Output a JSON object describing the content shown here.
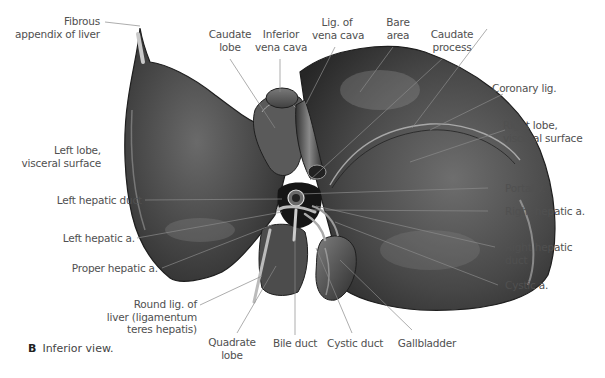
{
  "figure": {
    "caption_letter": "B",
    "caption_text": "Inferior view.",
    "colors": {
      "background": "#ffffff",
      "label_text": "#505050",
      "leader_line": "#8a8a8a",
      "organ_dark": "#2e2e2e",
      "organ_mid": "#5a5a5a",
      "organ_light": "#9a9a9a"
    }
  },
  "labels": {
    "fibrous_appendix": [
      "Fibrous",
      "appendix of liver"
    ],
    "caudate_lobe": [
      "Caudate",
      "lobe"
    ],
    "inferior_vena_cava": [
      "Inferior",
      "vena cava"
    ],
    "lig_vena_cava": [
      "Lig. of",
      "vena cava"
    ],
    "bare_area": [
      "Bare",
      "area"
    ],
    "caudate_process": [
      "Caudate",
      "process"
    ],
    "coronary_lig": "Coronary lig.",
    "right_lobe": [
      "Right lobe,",
      "visceral surface"
    ],
    "left_lobe": [
      "Left lobe,",
      "visceral surface"
    ],
    "left_hepatic_duct": "Left hepatic duct",
    "portal_v": "Portal v.",
    "right_hepatic_a": "Right hepatic a.",
    "left_hepatic_a": "Left hepatic a.",
    "right_hepatic_duct": [
      "Right hepatic",
      "duct"
    ],
    "proper_hepatic_a": "Proper hepatic a.",
    "cystic_a": "Cystic a.",
    "round_lig": [
      "Round lig. of",
      "liver (ligamentum",
      "teres hepatis)"
    ],
    "quadrate_lobe": [
      "Quadrate",
      "lobe"
    ],
    "bile_duct": "Bile duct",
    "cystic_duct": "Cystic duct",
    "gallbladder": "Gallbladder"
  }
}
